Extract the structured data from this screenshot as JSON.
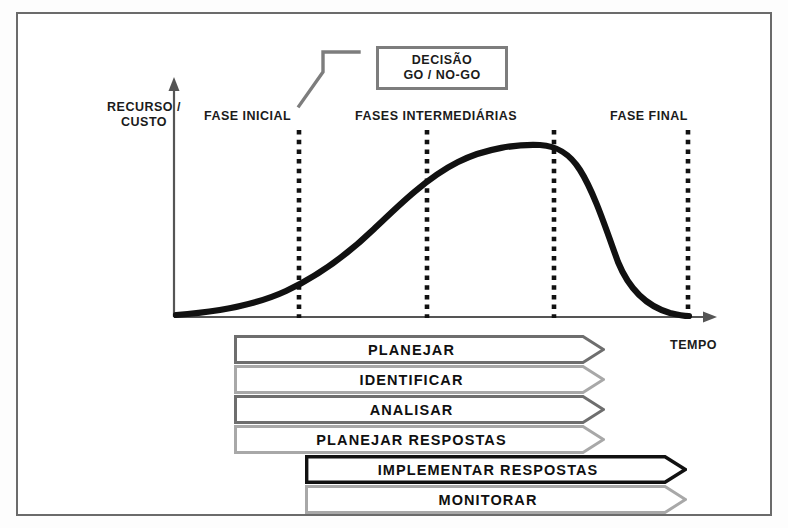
{
  "diagram": {
    "title_absent": true,
    "axes": {
      "y_label": "RECURSO /",
      "y_label_line2": "CUSTO",
      "x_label": "TEMPO"
    },
    "phases": [
      {
        "id": "inicial",
        "label": "FASE INICIAL"
      },
      {
        "id": "intermediarias",
        "label": "FASES INTERMEDIÁRIAS"
      },
      {
        "id": "final",
        "label": "FASE FINAL"
      }
    ],
    "decision_gate": {
      "line1": "DECISÃO",
      "line2": "GO / NO-GO"
    },
    "phase_dividers_x": [
      297,
      425,
      552,
      686
    ],
    "process_bars": [
      {
        "label": "PLANEJAR",
        "style": "gray-dark",
        "span": "early"
      },
      {
        "label": "IDENTIFICAR",
        "style": "gray-light",
        "span": "early"
      },
      {
        "label": "ANALISAR",
        "style": "gray-dark",
        "span": "early"
      },
      {
        "label": "PLANEJAR RESPOSTAS",
        "style": "gray-light",
        "span": "early"
      },
      {
        "label": "IMPLEMENTAR RESPOSTAS",
        "style": "black",
        "span": "late"
      },
      {
        "label": "MONITORAR",
        "style": "gray-light",
        "span": "late"
      }
    ],
    "colors": {
      "frame": "#6b6b6b",
      "curve": "#111111",
      "axis": "#555555",
      "bar_dark": "#6e6e6e",
      "bar_light": "#a8a8a8",
      "bar_black": "#111111",
      "gate_border": "#7d7d7d",
      "text": "#1b1b1b"
    }
  },
  "chart_data": {
    "type": "line",
    "xlabel": "TEMPO",
    "ylabel": "RECURSO / CUSTO",
    "grid": false,
    "legend": "none",
    "annotations": [
      "FASE INICIAL",
      "FASES INTERMEDIÁRIAS",
      "FASE FINAL",
      "DECISÃO GO / NO-GO"
    ],
    "x": [
      0,
      5,
      12,
      20,
      25,
      32,
      40,
      48,
      55,
      62,
      68,
      72,
      75,
      78,
      82,
      86,
      90,
      94,
      100
    ],
    "y": [
      2,
      3,
      5,
      9,
      12,
      19,
      30,
      45,
      62,
      78,
      90,
      95,
      96,
      94,
      82,
      55,
      28,
      12,
      4
    ],
    "xlim": [
      0,
      100
    ],
    "ylim": [
      0,
      100
    ]
  }
}
